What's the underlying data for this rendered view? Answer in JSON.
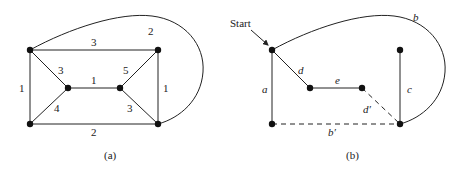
{
  "diagram_a": {
    "caption": "(a)",
    "edge_weights": {
      "top": "3",
      "curve": "2",
      "tl_ml": "3",
      "ml_mr": "1",
      "mr_tr": "5",
      "left": "1",
      "bl_ml": "4",
      "mr_br": "3",
      "right": "1",
      "bottom": "2"
    }
  },
  "diagram_b": {
    "caption": "(b)",
    "start_label": "Start",
    "edge_labels": {
      "curve": "b",
      "tl_ml": "d",
      "ml_mr": "e",
      "mr_br": "d′",
      "left": "a",
      "right": "c",
      "bottom": "b′"
    }
  }
}
